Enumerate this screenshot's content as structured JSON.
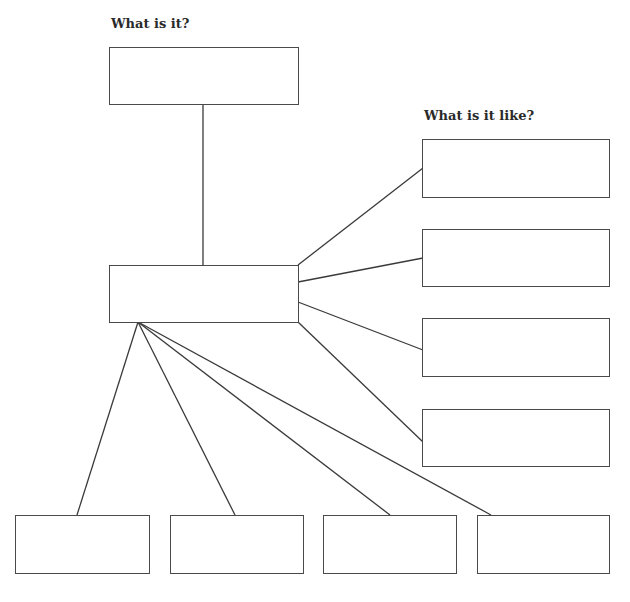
{
  "diagram": {
    "type": "graphic-organizer",
    "labels": {
      "what_is_it": "What is it?",
      "what_is_it_like": "What is it like?"
    },
    "colors": {
      "stroke": "#4a4a4a",
      "text": "#2a2a2a",
      "background": "#ffffff"
    },
    "boxes": {
      "top": {
        "content": ""
      },
      "center": {
        "content": ""
      },
      "right": [
        {
          "content": ""
        },
        {
          "content": ""
        },
        {
          "content": ""
        },
        {
          "content": ""
        }
      ],
      "bottom": [
        {
          "content": ""
        },
        {
          "content": ""
        },
        {
          "content": ""
        },
        {
          "content": ""
        }
      ]
    }
  }
}
